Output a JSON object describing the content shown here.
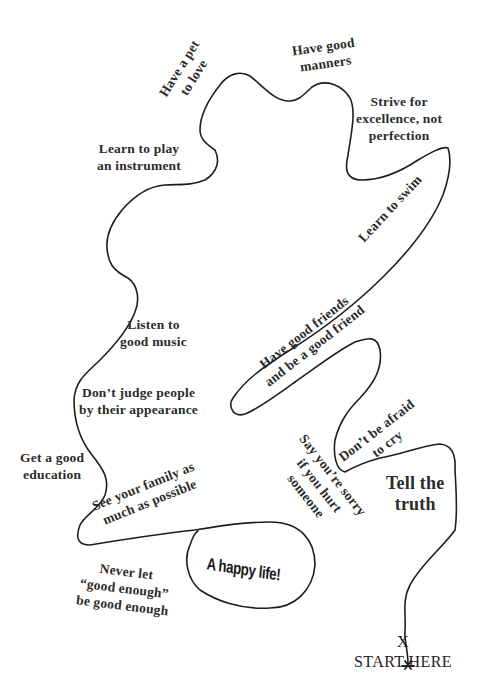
{
  "colors": {
    "background": "#ffffff",
    "path": "#1e1e1e",
    "text": "#2b2b2b"
  },
  "start": {
    "marker": "X",
    "label": "START HERE"
  },
  "destination": {
    "label": "A happy life!"
  },
  "milestones": [
    {
      "id": "tell-truth",
      "lines": [
        "Tell the",
        "truth"
      ]
    },
    {
      "id": "dont-be-afraid",
      "lines": [
        "Don’t be afraid",
        "to cry"
      ]
    },
    {
      "id": "say-sorry",
      "lines": [
        "Say you’re sorry",
        "if you hurt",
        "someone"
      ]
    },
    {
      "id": "good-friends",
      "lines": [
        "Have good friends",
        "and be a good friend"
      ]
    },
    {
      "id": "learn-swim",
      "lines": [
        "Learn to swim"
      ]
    },
    {
      "id": "strive",
      "lines": [
        "Strive for",
        "excellence, not",
        "perfection"
      ]
    },
    {
      "id": "manners",
      "lines": [
        "Have good",
        "manners"
      ]
    },
    {
      "id": "pet",
      "lines": [
        "Have a pet",
        "to love"
      ]
    },
    {
      "id": "instrument",
      "lines": [
        "Learn to play",
        "an instrument"
      ]
    },
    {
      "id": "music",
      "lines": [
        "Listen to",
        "good music"
      ]
    },
    {
      "id": "dont-judge",
      "lines": [
        "Don’t judge people",
        "by their appearance"
      ]
    },
    {
      "id": "education",
      "lines": [
        "Get a good",
        "education"
      ]
    },
    {
      "id": "family",
      "lines": [
        "See your family as",
        "much as possible"
      ]
    },
    {
      "id": "good-enough",
      "lines": [
        "Never let",
        "“good enough”",
        "be good enough"
      ]
    }
  ]
}
